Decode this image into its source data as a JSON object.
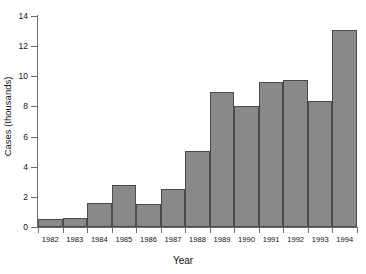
{
  "chart_data": {
    "type": "bar",
    "title": "",
    "xlabel": "Year",
    "ylabel": "Cases (thousands)",
    "categories": [
      "1982",
      "1983",
      "1984",
      "1985",
      "1986",
      "1987",
      "1988",
      "1989",
      "1990",
      "1991",
      "1992",
      "1993",
      "1994"
    ],
    "values": [
      0.55,
      0.6,
      1.6,
      2.8,
      1.55,
      2.5,
      5.05,
      8.95,
      8.05,
      9.65,
      9.75,
      8.35,
      13.1
    ],
    "ylim": [
      0,
      14
    ],
    "yticks": [
      0,
      2,
      4,
      6,
      8,
      10,
      12,
      14
    ],
    "ytick_labels": [
      "0",
      "2",
      "4",
      "6",
      "8",
      "10",
      "12",
      "14"
    ],
    "grid": false,
    "legend": null,
    "bar_color": "#898989",
    "bar_edge_color": "#4a4a4a",
    "axis_color": "#6e6e6e",
    "background": "#ffffff"
  }
}
